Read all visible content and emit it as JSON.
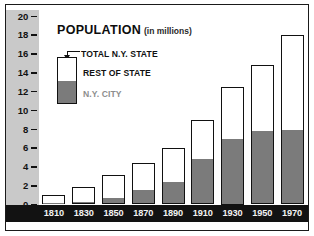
{
  "chart_data": {
    "type": "bar",
    "title": "POPULATION",
    "subtitle": "(in millions)",
    "xlabel": "",
    "ylabel": "",
    "ylim": [
      0,
      20
    ],
    "yticks": [
      0,
      2,
      4,
      6,
      8,
      10,
      12,
      14,
      16,
      18,
      20
    ],
    "grid": false,
    "legend_position": "inside-upper-left",
    "stacked": true,
    "categories": [
      "1810",
      "1830",
      "1850",
      "1870",
      "1890",
      "1910",
      "1930",
      "1950",
      "1970"
    ],
    "series": [
      {
        "name": "N.Y. CITY",
        "color": "#7b7b7b",
        "values": [
          0.1,
          0.2,
          0.6,
          1.4,
          2.3,
          4.7,
          6.8,
          7.7,
          7.8
        ]
      },
      {
        "name": "REST OF STATE",
        "color": "#ffffff",
        "values": [
          0.9,
          1.7,
          2.5,
          3.0,
          3.7,
          4.3,
          5.7,
          7.1,
          10.2
        ]
      }
    ],
    "totals": {
      "name": "TOTAL N.Y. STATE",
      "values": [
        1.0,
        1.9,
        3.1,
        4.4,
        6.0,
        9.0,
        12.5,
        14.8,
        18.0
      ]
    },
    "annotations": [
      "TOTAL N.Y. STATE pointer to top of legend sample bar"
    ]
  },
  "legend": {
    "total_label": "TOTAL N.Y. STATE",
    "rest_label": "REST OF STATE",
    "city_label": "N.Y. CITY"
  },
  "colors": {
    "city_fill": "#7b7b7b",
    "state_fill": "#ffffff",
    "axis_band": "#c9c9c9",
    "xaxis_band": "#121212",
    "outline": "#111111",
    "city_label_text": "#8d8d8d"
  }
}
